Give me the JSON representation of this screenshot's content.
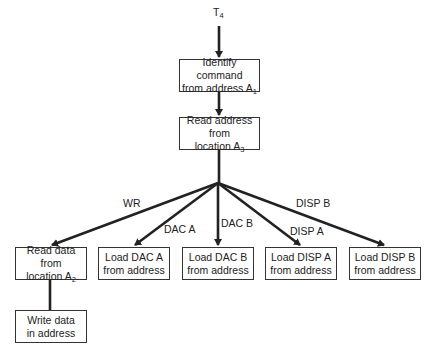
{
  "diagram": {
    "start": {
      "text": "T",
      "sub": "4"
    },
    "nodes": {
      "identify": {
        "line1": "Identify command",
        "line2": "from address A",
        "sub": "1"
      },
      "read_address": {
        "line1": "Read address from",
        "line2": "location A",
        "sub": "3"
      },
      "read_data": {
        "line1": "Read data from",
        "line2": "location A",
        "sub": "2"
      },
      "load_dac_a": {
        "line1": "Load DAC A",
        "line2": "from address"
      },
      "load_dac_b": {
        "line1": "Load DAC B",
        "line2": "from address"
      },
      "load_disp_a": {
        "line1": "Load DISP A",
        "line2": "from address"
      },
      "load_disp_b": {
        "line1": "Load DISP B",
        "line2": "from address"
      },
      "write_data": {
        "line1": "Write data",
        "line2": "in address"
      }
    },
    "edge_labels": {
      "wr": "WR",
      "dac_a": "DAC A",
      "dac_b": "DAC B",
      "disp_a": "DISP A",
      "disp_b": "DISP B"
    }
  }
}
